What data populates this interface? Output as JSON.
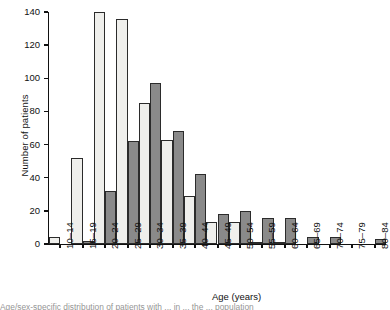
{
  "chart_data": {
    "type": "bar",
    "title": "",
    "xlabel": "Age (years)",
    "ylabel": "Number of patients",
    "ylim": [
      0,
      140
    ],
    "yticks": [
      0,
      20,
      40,
      60,
      80,
      100,
      120,
      140
    ],
    "grid": false,
    "legend": "none",
    "categories": [
      "10–14",
      "15–19",
      "20–24",
      "25–29",
      "30–34",
      "35–39",
      "40–44",
      "45–49",
      "50–54",
      "55–59",
      "60–64",
      "65–69",
      "70–74",
      "75–79",
      "80–84"
    ],
    "series": [
      {
        "name": "light",
        "color": "#efefec",
        "values": [
          4,
          52,
          140,
          136,
          85,
          63,
          29,
          13,
          13,
          1,
          1,
          0,
          0,
          0,
          0
        ]
      },
      {
        "name": "dark",
        "color": "#8a8a8a",
        "values": [
          0,
          2,
          32,
          62,
          97,
          68,
          42,
          18,
          20,
          16,
          16,
          4,
          4,
          0,
          3
        ]
      }
    ]
  },
  "caption": "Age/sex-specific distribution of patients with ... in ... the ... population",
  "axis": {
    "x_title": "Age (years)",
    "y_title": "Number of patients"
  }
}
